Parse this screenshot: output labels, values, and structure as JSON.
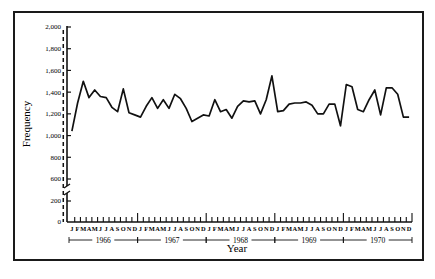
{
  "chart_data": {
    "type": "line",
    "title": "",
    "xlabel": "Year",
    "ylabel": "Frequency",
    "ylim": [
      0,
      2000
    ],
    "y_axis_break": {
      "between": [
        200,
        600
      ]
    },
    "yticks": [
      0,
      200,
      600,
      800,
      1000,
      1200,
      1400,
      1600,
      1800,
      2000
    ],
    "ytick_labels": [
      "0",
      "200",
      "600",
      "800",
      "1,000",
      "1,200",
      "1,400",
      "1,600",
      "1,800",
      "2,000"
    ],
    "month_labels": [
      "J",
      "F",
      "M",
      "A",
      "M",
      "J",
      "J",
      "A",
      "S",
      "O",
      "N",
      "D"
    ],
    "years": [
      "1966",
      "1967",
      "1968",
      "1969",
      "1970"
    ],
    "grid": false,
    "legend": null,
    "annotations": [
      {
        "type": "vertical-dashed-line",
        "position": "1967-Oct",
        "description": "intervention marker"
      }
    ],
    "series": [
      {
        "name": "Frequency",
        "x": [
          "1966-01",
          "1966-02",
          "1966-03",
          "1966-04",
          "1966-05",
          "1966-06",
          "1966-07",
          "1966-08",
          "1966-09",
          "1966-10",
          "1966-11",
          "1966-12",
          "1967-01",
          "1967-02",
          "1967-03",
          "1967-04",
          "1967-05",
          "1967-06",
          "1967-07",
          "1967-08",
          "1967-09",
          "1967-10",
          "1967-11",
          "1967-12",
          "1968-01",
          "1968-02",
          "1968-03",
          "1968-04",
          "1968-05",
          "1968-06",
          "1968-07",
          "1968-08",
          "1968-09",
          "1968-10",
          "1968-11",
          "1968-12",
          "1969-01",
          "1969-02",
          "1969-03",
          "1969-04",
          "1969-05",
          "1969-06",
          "1969-07",
          "1969-08",
          "1969-09",
          "1969-10",
          "1969-11",
          "1969-12",
          "1970-01",
          "1970-02",
          "1970-03",
          "1970-04",
          "1970-05",
          "1970-06",
          "1970-07",
          "1970-08",
          "1970-09",
          "1970-10",
          "1970-11",
          "1970-12"
        ],
        "values": [
          1040,
          1300,
          1500,
          1350,
          1420,
          1360,
          1350,
          1260,
          1220,
          1430,
          1210,
          1190,
          1170,
          1270,
          1350,
          1250,
          1330,
          1250,
          1380,
          1340,
          1250,
          1130,
          1160,
          1190,
          1180,
          1330,
          1220,
          1240,
          1160,
          1270,
          1320,
          1310,
          1320,
          1200,
          1330,
          1550,
          1220,
          1230,
          1290,
          1300,
          1300,
          1310,
          1280,
          1200,
          1200,
          1290,
          1290,
          1090,
          1470,
          1450,
          1240,
          1220,
          1330,
          1420,
          1190,
          1440,
          1440,
          1380,
          1170,
          1170
        ]
      }
    ]
  }
}
